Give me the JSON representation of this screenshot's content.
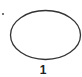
{
  "diagram": {
    "shape": "ellipse",
    "label": "1",
    "marker": "dot",
    "colors": {
      "stroke": "#333333",
      "dot": "#444444",
      "label": "#222222",
      "background": "#ffffff"
    }
  }
}
